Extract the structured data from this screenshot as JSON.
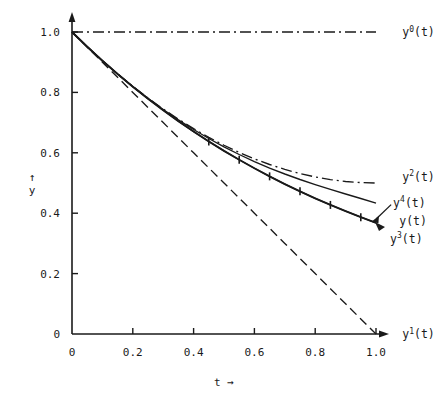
{
  "chart_data": {
    "type": "line",
    "title": "",
    "xlabel": "t →",
    "ylabel": "↑ y",
    "xlim": [
      0,
      1.0
    ],
    "ylim": [
      0,
      1.0
    ],
    "grid": false,
    "legend_position": "inline-right-labels",
    "xticks": [
      "0",
      "0.2",
      "0.4",
      "0.6",
      "0.8",
      "1.0"
    ],
    "xtick_values": [
      0,
      0.2,
      0.4,
      0.6,
      0.8,
      1.0
    ],
    "yticks": [
      "0",
      "0.2",
      "0.4",
      "0.6",
      "0.8",
      "1.0"
    ],
    "ytick_values": [
      0,
      0.2,
      0.4,
      0.6,
      0.8,
      1.0
    ],
    "x": [
      0,
      0.05,
      0.1,
      0.15,
      0.2,
      0.25,
      0.3,
      0.35,
      0.4,
      0.45,
      0.5,
      0.55,
      0.6,
      0.65,
      0.7,
      0.75,
      0.8,
      0.85,
      0.9,
      0.95,
      1.0
    ],
    "series": [
      {
        "name": "y0",
        "label": "y0(t)",
        "label_base": "y",
        "label_sup": "0",
        "label_tail": "(t)",
        "style": "dashdot",
        "markers": false,
        "color": "#1a1a1a",
        "values": [
          1.0,
          1.0,
          1.0,
          1.0,
          1.0,
          1.0,
          1.0,
          1.0,
          1.0,
          1.0,
          1.0,
          1.0,
          1.0,
          1.0,
          1.0,
          1.0,
          1.0,
          1.0,
          1.0,
          1.0,
          1.0
        ],
        "label_xy": [
          1.06,
          1.0
        ]
      },
      {
        "name": "y1",
        "label": "y1(t)",
        "label_base": "y",
        "label_sup": "1",
        "label_tail": "(t)",
        "style": "dashed",
        "markers": false,
        "color": "#1a1a1a",
        "values": [
          1.0,
          0.95,
          0.9,
          0.85,
          0.8,
          0.75,
          0.7,
          0.65,
          0.6,
          0.55,
          0.5,
          0.45,
          0.4,
          0.35,
          0.3,
          0.25,
          0.2,
          0.15,
          0.1,
          0.05,
          0.0
        ],
        "label_xy": [
          1.06,
          0.0
        ]
      },
      {
        "name": "y2",
        "label": "y2(t)",
        "label_base": "y",
        "label_sup": "2",
        "label_tail": "(t)",
        "style": "dashdot",
        "markers": false,
        "color": "#1a1a1a",
        "values": [
          1.0,
          0.9513,
          0.905,
          0.8613,
          0.82,
          0.7813,
          0.745,
          0.7113,
          0.68,
          0.6513,
          0.625,
          0.6013,
          0.58,
          0.5613,
          0.545,
          0.5313,
          0.52,
          0.5113,
          0.505,
          0.5013,
          0.5
        ],
        "label_xy": [
          1.06,
          0.52
        ]
      },
      {
        "name": "y3",
        "label": "y3(t)",
        "label_base": "y",
        "label_sup": "3",
        "label_tail": "(t)",
        "style": "solid",
        "markers": false,
        "color": "#1a1a1a",
        "values": [
          1.0,
          0.9512,
          0.9048,
          0.8609,
          0.8194,
          0.7803,
          0.7435,
          0.7091,
          0.6771,
          0.6474,
          0.6198,
          0.5944,
          0.571,
          0.5495,
          0.5298,
          0.5116,
          0.4947,
          0.4788,
          0.4636,
          0.4486,
          0.4333
        ],
        "label_xy": [
          1.02,
          0.315
        ]
      },
      {
        "name": "y4",
        "label": "y4(t)",
        "label_base": "y",
        "label_sup": "4",
        "label_tail": "(t)",
        "style": "solid",
        "markers": false,
        "color": "#1a1a1a",
        "values": [
          1.0,
          0.9512,
          0.9048,
          0.8607,
          0.8187,
          0.7788,
          0.7408,
          0.7047,
          0.6703,
          0.6376,
          0.6065,
          0.5769,
          0.5488,
          0.522,
          0.4966,
          0.4724,
          0.4493,
          0.4274,
          0.4066,
          0.3867,
          0.3679
        ],
        "label_xy": [
          1.03,
          0.435
        ]
      },
      {
        "name": "y",
        "label": "y(t)",
        "label_base": "y",
        "label_sup": "",
        "label_tail": "(t)",
        "style": "solid-marked",
        "markers": true,
        "marker_style": "vertical-tick",
        "color": "#1a1a1a",
        "values": [
          1.0,
          0.9512,
          0.9048,
          0.8607,
          0.8187,
          0.7788,
          0.7408,
          0.7047,
          0.6703,
          0.6376,
          0.6065,
          0.5769,
          0.5488,
          0.522,
          0.4966,
          0.4724,
          0.4493,
          0.4274,
          0.4066,
          0.3867,
          0.3679
        ],
        "marker_x": [
          0.45,
          0.55,
          0.65,
          0.75,
          0.85,
          0.95
        ],
        "marker_y": [
          0.6376,
          0.5769,
          0.522,
          0.4724,
          0.4274,
          0.3867
        ],
        "label_xy": [
          1.05,
          0.375
        ]
      }
    ]
  },
  "axes": {
    "x_axis_name": "t-axis",
    "y_axis_name": "y-axis",
    "x_label_text": "t",
    "x_label_arrow": "→",
    "y_label_text": "y",
    "y_label_arrow": "↑"
  }
}
